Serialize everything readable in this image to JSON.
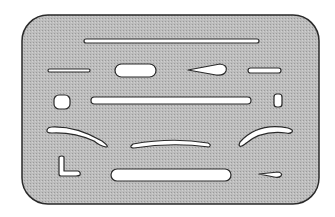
{
  "figure": {
    "colors": {
      "background": "#ffffff",
      "shield_fill": "#b8b8b8",
      "outline": "#2a2a2a",
      "cutout": "#ffffff"
    },
    "shield": {
      "x": 22,
      "y": 15,
      "w": 297,
      "h": 189,
      "r": 26
    },
    "slots": [
      {
        "name": "long-top-slot",
        "x": 84,
        "y": 39,
        "w": 175,
        "h": 4,
        "r": 2
      },
      {
        "name": "short-left-slot",
        "x": 48,
        "y": 69,
        "w": 42,
        "h": 3,
        "r": 1.5
      },
      {
        "name": "oval-slot",
        "x": 115,
        "y": 64,
        "w": 41,
        "h": 13,
        "r": 6.5
      },
      {
        "name": "right-short-slot",
        "x": 248,
        "y": 68,
        "w": 33,
        "h": 5,
        "r": 2.5
      },
      {
        "name": "square-hole",
        "x": 54,
        "y": 95,
        "w": 16,
        "h": 14,
        "r": 5
      },
      {
        "name": "middle-long-slot",
        "x": 91,
        "y": 97,
        "w": 160,
        "h": 7,
        "r": 3.5
      },
      {
        "name": "small-rect-hole",
        "x": 274,
        "y": 94,
        "w": 8,
        "h": 13,
        "r": 3
      },
      {
        "name": "bottom-long-slot",
        "x": 111,
        "y": 169,
        "w": 120,
        "h": 12,
        "r": 6
      }
    ],
    "paths": [
      {
        "name": "teardrop-slot",
        "d": "M188,70 L220,64 Q228,65 226,71 Q224,76 216,75 Z"
      },
      {
        "name": "small-teardrop-slot",
        "d": "M259,174 L278,172 Q283,173 281,176 Q279,178 274,177 Z"
      },
      {
        "name": "left-arc-slot",
        "d": "M52,127 Q76,126 102,141 Q110,147 106,147 Q100,146 94,141 Q74,132 52,133 Q46,133 47,130 Q48,127 52,127 Z"
      },
      {
        "name": "middle-arc-slot",
        "d": "M133,144 Q172,137 208,143 Q212,145 209,147 Q172,142 134,148 Q130,148 131,146 Z"
      },
      {
        "name": "right-arc-slot",
        "d": "M240,142 Q258,122 288,128 Q294,130 292,132 Q290,134 286,133 Q261,130 245,144 Q240,148 239,145 Z"
      },
      {
        "name": "l-shape-slot",
        "d": "M59,157 Q62,155 64,157 L64,171 L78,171 Q81,172 80,175 Q79,176 76,176 L61,176 Q59,176 59,174 Z"
      }
    ]
  }
}
